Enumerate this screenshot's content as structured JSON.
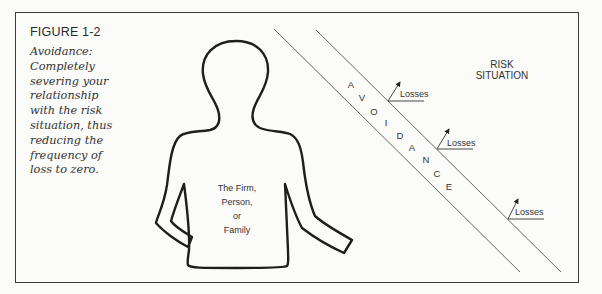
{
  "figure": {
    "label": "FIGURE 1-2",
    "caption": "Avoidance: Completely severing your relationship with the risk situation, thus reducing the frequency of loss to zero."
  },
  "person": {
    "lines": [
      "The Firm,",
      "Person,",
      "or",
      "Family"
    ]
  },
  "barrier": {
    "letters": [
      "A",
      "V",
      "O",
      "I",
      "D",
      "A",
      "N",
      "C",
      "E"
    ]
  },
  "risk_situation": {
    "lines": [
      "RISK",
      "SITUATION"
    ]
  },
  "losses": [
    {
      "label": "Losses"
    },
    {
      "label": "Losses"
    },
    {
      "label": "Losses"
    }
  ],
  "colors": {
    "ink": "#333333",
    "line": "#555555",
    "background": "#fbfbf9"
  }
}
